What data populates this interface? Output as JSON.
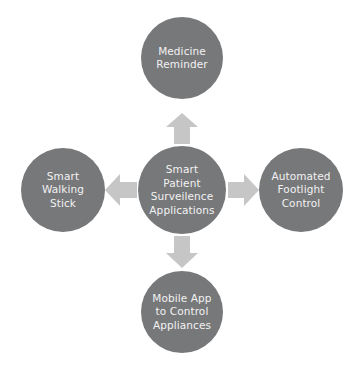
{
  "diagram": {
    "type": "hub-and-spoke",
    "title": "Smart Patient Surveilence Applications",
    "colors": {
      "node_fill": "#77787a",
      "node_text": "#f2f2f2",
      "arrow_fill": "#c6c6c6",
      "background": "#ffffff"
    },
    "center": {
      "id": "center",
      "label": "Smart\nPatient\nSurveilence\nApplications"
    },
    "nodes": [
      {
        "id": "top",
        "label": "Medicine\nReminder",
        "position": "top"
      },
      {
        "id": "left",
        "label": "Smart\nWalking\nStick",
        "position": "left"
      },
      {
        "id": "right",
        "label": "Automated\nFootlight\nControl",
        "position": "right"
      },
      {
        "id": "bottom",
        "label": "Mobile App\nto Control\nAppliances",
        "position": "bottom"
      }
    ],
    "arrows": [
      {
        "id": "up",
        "direction": "up",
        "from": "center",
        "to": "top"
      },
      {
        "id": "right",
        "direction": "right",
        "from": "center",
        "to": "right"
      },
      {
        "id": "down",
        "direction": "down",
        "from": "center",
        "to": "bottom"
      },
      {
        "id": "left",
        "direction": "left",
        "from": "center",
        "to": "left"
      }
    ]
  }
}
